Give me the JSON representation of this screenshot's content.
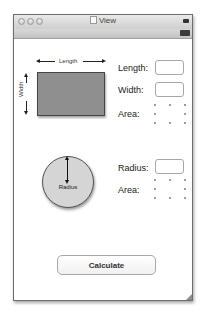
{
  "window": {
    "title": "View",
    "title_icon": "document-icon"
  },
  "rectangle": {
    "diagram_length_label": "Length",
    "diagram_width_label": "Width",
    "fields": [
      {
        "label": "Length:",
        "value": "",
        "type": "input"
      },
      {
        "label": "Width:",
        "value": "",
        "type": "input"
      },
      {
        "label": "Area:",
        "value": "",
        "type": "output-placeholder"
      }
    ]
  },
  "circle": {
    "diagram_radius_label": "Radius",
    "fields": [
      {
        "label": "Radius:",
        "value": "",
        "type": "input"
      },
      {
        "label": "Area:",
        "value": "",
        "type": "output-placeholder"
      }
    ]
  },
  "actions": {
    "calculate_label": "Calculate"
  },
  "colors": {
    "rect_fill": "#8f8f8f",
    "circle_fill": "#d5d5d5",
    "window_border": "#6e6e6e"
  }
}
